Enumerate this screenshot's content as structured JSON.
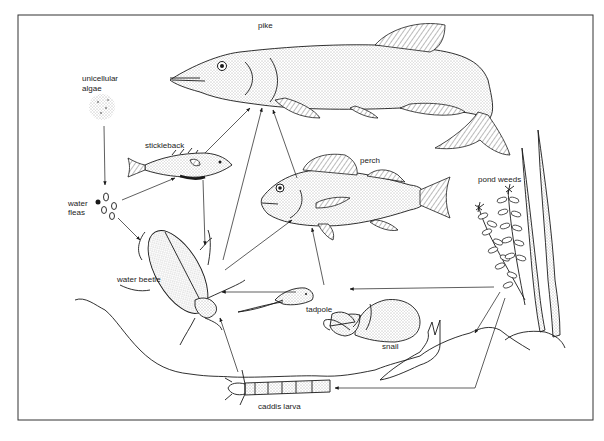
{
  "diagram": {
    "type": "food-web",
    "setting": "pond",
    "organisms": [
      {
        "id": "algae",
        "label_line1": "unicellular",
        "label_line2": "algae"
      },
      {
        "id": "water_fleas",
        "label_line1": "water",
        "label_line2": "fleas"
      },
      {
        "id": "stickleback",
        "label": "stickleback"
      },
      {
        "id": "pike",
        "label": "pike"
      },
      {
        "id": "perch",
        "label": "perch"
      },
      {
        "id": "water_beetle",
        "label": "water beetle"
      },
      {
        "id": "tadpole",
        "label": "tadpole"
      },
      {
        "id": "snail",
        "label": "snail"
      },
      {
        "id": "pond_weeds",
        "label": "pond weeds"
      },
      {
        "id": "caddis_larva",
        "label": "caddis larva"
      }
    ],
    "feeding_links": [
      {
        "from": "unicellular algae",
        "to": "water fleas"
      },
      {
        "from": "water fleas",
        "to": "stickleback"
      },
      {
        "from": "water fleas",
        "to": "water beetle"
      },
      {
        "from": "stickleback",
        "to": "pike"
      },
      {
        "from": "stickleback",
        "to": "water beetle"
      },
      {
        "from": "water beetle",
        "to": "pike"
      },
      {
        "from": "water beetle",
        "to": "perch"
      },
      {
        "from": "perch",
        "to": "pike"
      },
      {
        "from": "tadpole",
        "to": "perch"
      },
      {
        "from": "tadpole",
        "to": "water beetle"
      },
      {
        "from": "pond weeds",
        "to": "tadpole"
      },
      {
        "from": "pond weeds",
        "to": "snail"
      },
      {
        "from": "pond weeds",
        "to": "caddis larva"
      },
      {
        "from": "caddis larva",
        "to": "water beetle"
      }
    ]
  },
  "colors": {
    "ink": "#1a1a1a",
    "background": "#ffffff",
    "frame": "#333333"
  }
}
